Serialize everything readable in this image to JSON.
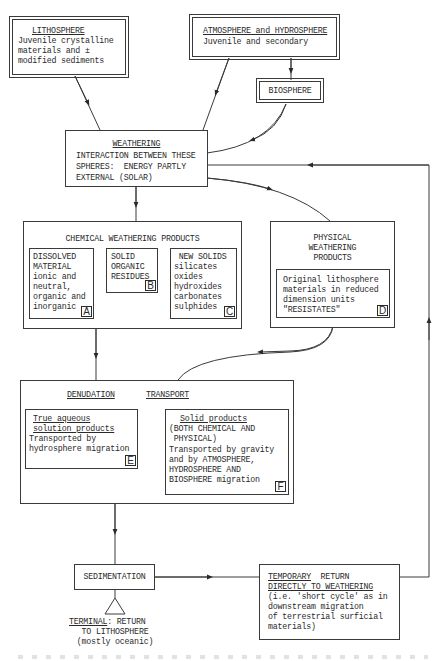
{
  "diagram": {
    "type": "flowchart",
    "nodes": {
      "lithosphere": {
        "title": "LITHOSPHERE",
        "lines": [
          "Juvenile crystalline",
          "materials and ±",
          "modified sediments"
        ]
      },
      "atmosphere": {
        "title": "ATMOSPHERE and HYDROSPHERE",
        "lines": [
          "Juvenile and secondary"
        ]
      },
      "biosphere": {
        "title": "BIOSPHERE"
      },
      "weathering": {
        "title": "WEATHERING",
        "lines": [
          "INTERACTION BETWEEN THESE",
          "SPHERES:  ENERGY PARTLY",
          "EXTERNAL (SOLAR)"
        ]
      },
      "chemical": {
        "title": "CHEMICAL WEATHERING PRODUCTS",
        "sub": {
          "a": {
            "lines": [
              "DISSOLVED",
              "MATERIAL",
              "ionic and",
              "neutral,",
              "organic and",
              "inorganic"
            ],
            "tag": "A"
          },
          "b": {
            "lines": [
              "SOLID",
              "ORGANIC",
              "RESIDUES"
            ],
            "tag": "B"
          },
          "c": {
            "lines": [
              " NEW SOLIDS",
              "silicates",
              "oxides",
              "hydroxides",
              "carbonates",
              "sulphides"
            ],
            "tag": "C"
          }
        }
      },
      "physical": {
        "title_lines": [
          "PHYSICAL",
          "WEATHERING",
          "PRODUCTS"
        ],
        "sub": {
          "d": {
            "lines": [
              "Original lithosphere",
              "materials in reduced",
              "dimension units",
              "\"RESISTATES\""
            ],
            "tag": "D"
          }
        }
      },
      "denudation": {
        "title_left": "DENUDATION",
        "title_right": "TRANSPORT",
        "sub": {
          "e": {
            "title_lines": [
              "True aqueous",
              "solution products"
            ],
            "lines": [
              "Transported by",
              "hydrosphere migration"
            ],
            "tag": "E"
          },
          "f": {
            "title": "Solid products",
            "lines": [
              "(BOTH CHEMICAL AND",
              " PHYSICAL)",
              "Transported by gravity",
              "and by ATMOSPHERE,",
              "HYDROSPHERE AND",
              "BIOSPHERE migration"
            ],
            "tag": "F"
          }
        }
      },
      "sedimentation": {
        "title": "SEDIMENTATION"
      },
      "terminal": {
        "title": "TERMINAL",
        "title_suffix": ": RETURN",
        "lines": [
          "TO LITHOSPHERE",
          "(mostly oceanic)"
        ]
      },
      "temporary": {
        "title": "TEMPORARY",
        "title_suffix": "  RETURN",
        "lines": [
          "DIRECTLY TO WEATHERING",
          "(i.e. 'short cycle' as in",
          "downstream migration",
          "of terrestrial surficial",
          "materials)"
        ]
      }
    },
    "edges": [
      {
        "from": "lithosphere",
        "to": "weathering"
      },
      {
        "from": "atmosphere",
        "to": "weathering"
      },
      {
        "from": "atmosphere",
        "to": "biosphere"
      },
      {
        "from": "biosphere",
        "to": "weathering"
      },
      {
        "from": "weathering",
        "to": "chemical"
      },
      {
        "from": "weathering",
        "to": "physical"
      },
      {
        "from": "chemical",
        "to": "denudation"
      },
      {
        "from": "physical",
        "to": "denudation"
      },
      {
        "from": "denudation",
        "to": "sedimentation"
      },
      {
        "from": "sedimentation",
        "to": "temporary"
      },
      {
        "from": "sedimentation",
        "to": "terminal"
      },
      {
        "from": "temporary",
        "to": "weathering"
      }
    ]
  }
}
